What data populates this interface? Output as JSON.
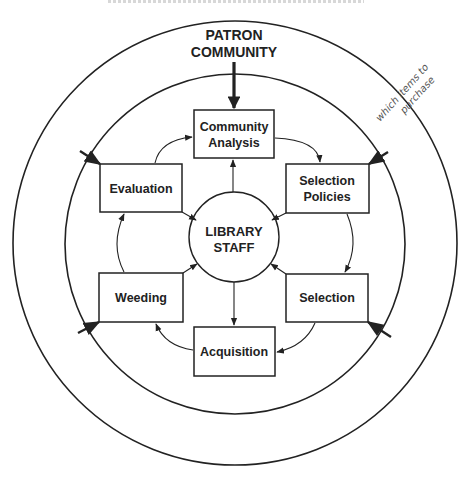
{
  "diagram": {
    "outer_label": [
      "PATRON",
      "COMMUNITY"
    ],
    "center_label": [
      "LIBRARY",
      "STAFF"
    ],
    "boxes": [
      {
        "id": "community-analysis",
        "lines": [
          "Community",
          "Analysis"
        ]
      },
      {
        "id": "selection-policies",
        "lines": [
          "Selection",
          "Policies"
        ]
      },
      {
        "id": "selection",
        "lines": [
          "Selection"
        ]
      },
      {
        "id": "acquisition",
        "lines": [
          "Acquisition"
        ]
      },
      {
        "id": "weeding",
        "lines": [
          "Weeding"
        ]
      },
      {
        "id": "evaluation",
        "lines": [
          "Evaluation"
        ]
      }
    ],
    "cycle_order": [
      "Community Analysis",
      "Selection Policies",
      "Selection",
      "Acquisition",
      "Weeding",
      "Evaluation"
    ],
    "center_connections": "Library Staff links to all six stages",
    "handwritten_note": [
      "which items to",
      "purchase"
    ],
    "colors": {
      "ink": "#222222",
      "paper": "#ffffff",
      "pencil": "#555555"
    }
  }
}
